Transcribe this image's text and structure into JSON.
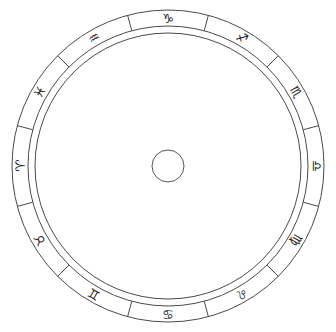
{
  "diagram": {
    "type": "zodiac-wheel",
    "line_color": "#4a4a4a",
    "background": "#ffffff",
    "signs": [
      {
        "name": "Aries",
        "glyph": "♈︎",
        "angle_deg": 180
      },
      {
        "name": "Taurus",
        "glyph": "♉︎",
        "angle_deg": 210
      },
      {
        "name": "Gemini",
        "glyph": "♊︎",
        "angle_deg": 240
      },
      {
        "name": "Cancer",
        "glyph": "♋︎",
        "angle_deg": 270
      },
      {
        "name": "Leo",
        "glyph": "♌︎",
        "angle_deg": 300
      },
      {
        "name": "Virgo",
        "glyph": "♍︎",
        "angle_deg": 330
      },
      {
        "name": "Libra",
        "glyph": "♎︎",
        "angle_deg": 0
      },
      {
        "name": "Scorpio",
        "glyph": "♏︎",
        "angle_deg": 30
      },
      {
        "name": "Sagittarius",
        "glyph": "♐︎",
        "angle_deg": 60
      },
      {
        "name": "Capricorn",
        "glyph": "♑︎",
        "angle_deg": 90
      },
      {
        "name": "Aquarius",
        "glyph": "♒︎",
        "angle_deg": 120
      },
      {
        "name": "Pisces",
        "glyph": "♓︎",
        "angle_deg": 150
      }
    ]
  }
}
